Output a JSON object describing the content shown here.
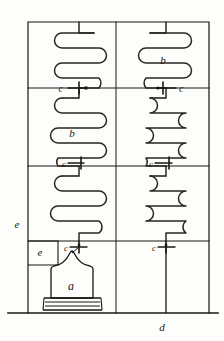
{
  "figure": {
    "domain": "technical-line-drawing",
    "ink_color": "#1a1713",
    "paper_color": "#fdfdfb",
    "canvas": {
      "width": 224,
      "height": 341
    }
  },
  "frame": {
    "left": 28,
    "right": 209,
    "top": 22,
    "baseline": 313,
    "center_divider_x": 116,
    "horizontal_dividers": [
      88,
      166,
      241
    ]
  },
  "labels": {
    "furnace": "a",
    "coil_left_middle": "b",
    "coil_right_top": "b",
    "valve": "c",
    "outlet_pipe": "d",
    "casing_outer": "e",
    "casing_inner": "e"
  },
  "annotations": [
    {
      "id": "valve-left-upper",
      "text": "c",
      "x": 63,
      "y": 92,
      "side": "left"
    },
    {
      "id": "valve-right-upper",
      "text": "c",
      "x": 167,
      "y": 92,
      "side": "right"
    },
    {
      "id": "valve-left-mid",
      "text": "c",
      "x": 63,
      "y": 167,
      "side": "left"
    },
    {
      "id": "valve-right-mid",
      "text": "c",
      "x": 150,
      "y": 167,
      "side": "left"
    },
    {
      "id": "valve-left-lower",
      "text": "c",
      "x": 63,
      "y": 249,
      "side": "left"
    },
    {
      "id": "valve-right-lower",
      "text": "c",
      "x": 150,
      "y": 249,
      "side": "left"
    },
    {
      "id": "coil-label-left-middle",
      "text": "b",
      "x": 72,
      "y": 136
    },
    {
      "id": "coil-label-right-top",
      "text": "b",
      "x": 163,
      "y": 64
    },
    {
      "id": "furnace-label",
      "text": "a",
      "x": 71,
      "y": 288
    },
    {
      "id": "casing-label-outer",
      "text": "e",
      "x": 17,
      "y": 226
    },
    {
      "id": "casing-label-inner",
      "text": "e",
      "x": 39,
      "y": 253
    },
    {
      "id": "outlet-label",
      "text": "d",
      "x": 160,
      "y": 330
    }
  ],
  "components": {
    "furnace": {
      "name": "furnace",
      "label": "a",
      "shape": "ogee-arch-with-grate"
    },
    "grate_bars": 3,
    "coils": [
      {
        "id": "coil-left-top",
        "column": "left",
        "row": "top",
        "turns": 3,
        "label": ""
      },
      {
        "id": "coil-right-top",
        "column": "right",
        "row": "top",
        "turns": 3,
        "label": "b"
      },
      {
        "id": "coil-left-middle",
        "column": "left",
        "row": "middle",
        "turns": 4,
        "label": "b"
      },
      {
        "id": "coil-right-middle",
        "column": "right",
        "row": "middle",
        "turns": 4,
        "label": ""
      },
      {
        "id": "coil-left-lower",
        "column": "left",
        "row": "lower",
        "turns": 4,
        "label": ""
      },
      {
        "id": "coil-right-lower",
        "column": "right",
        "row": "lower",
        "turns": 4,
        "label": ""
      }
    ],
    "valves": [
      {
        "id": "valve-left-upper",
        "label": "c"
      },
      {
        "id": "valve-right-upper",
        "label": "c"
      },
      {
        "id": "valve-left-mid",
        "label": "c"
      },
      {
        "id": "valve-right-mid",
        "label": "c"
      },
      {
        "id": "valve-left-lower",
        "label": "c"
      },
      {
        "id": "valve-right-lower",
        "label": "c"
      }
    ],
    "outlet_pipe": {
      "id": "outlet-pipe",
      "label": "d"
    },
    "casing_box": {
      "id": "casing-box",
      "label": "e"
    }
  }
}
